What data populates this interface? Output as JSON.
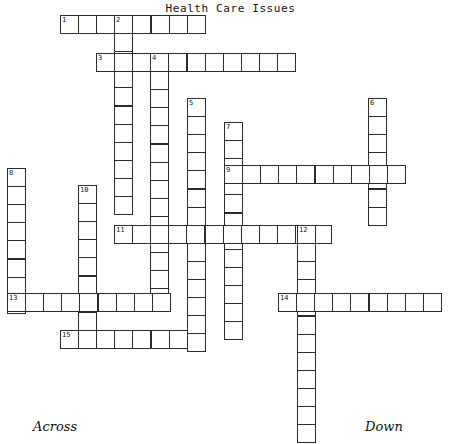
{
  "puzzle": {
    "title": "Health Care Issues",
    "across_label": "Across",
    "down_label": "Down",
    "cell_size": 18.1,
    "colors": {
      "cell_border": "#2b2b2b",
      "cell_fill": "#ffffff",
      "page_background": "#ffffff",
      "text": "#111111"
    },
    "entries": [
      {
        "number": "1",
        "direction": "across",
        "x": 60,
        "y": 15,
        "length": 8
      },
      {
        "number": "2",
        "direction": "down",
        "x": 114,
        "y": 15,
        "length": 11
      },
      {
        "number": "3",
        "direction": "across",
        "x": 96,
        "y": 53,
        "length": 11
      },
      {
        "number": "4",
        "direction": "down",
        "x": 150,
        "y": 53,
        "length": 14
      },
      {
        "number": "5",
        "direction": "down",
        "x": 187,
        "y": 98,
        "length": 14
      },
      {
        "number": "6",
        "direction": "down",
        "x": 368,
        "y": 98,
        "length": 7
      },
      {
        "number": "7",
        "direction": "down",
        "x": 224,
        "y": 122,
        "length": 12
      },
      {
        "number": "8",
        "direction": "down",
        "x": 7,
        "y": 168,
        "length": 8
      },
      {
        "number": "9",
        "direction": "across",
        "x": 224,
        "y": 165,
        "length": 10
      },
      {
        "number": "10",
        "direction": "down",
        "x": 78,
        "y": 185,
        "length": 9
      },
      {
        "number": "11",
        "direction": "across",
        "x": 114,
        "y": 225,
        "length": 12
      },
      {
        "number": "12",
        "direction": "down",
        "x": 297,
        "y": 225,
        "length": 12
      },
      {
        "number": "13",
        "direction": "across",
        "x": 7,
        "y": 293,
        "length": 9
      },
      {
        "number": "14",
        "direction": "across",
        "x": 278,
        "y": 293,
        "length": 9
      },
      {
        "number": "15",
        "direction": "across",
        "x": 60,
        "y": 330,
        "length": 7
      }
    ]
  }
}
